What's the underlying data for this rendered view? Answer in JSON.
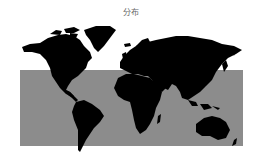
{
  "map": {
    "title": "分布",
    "land_color": "#000000",
    "region_color": "#8c8c8c",
    "background": "#ffffff",
    "highlighted_region": {
      "shape": "rectangle",
      "description": "gray band covering roughly 40°N to 45°S, across all longitudes",
      "x": 20,
      "y": 70,
      "width": 223,
      "height": 76
    },
    "projection": "Mercator world map"
  }
}
